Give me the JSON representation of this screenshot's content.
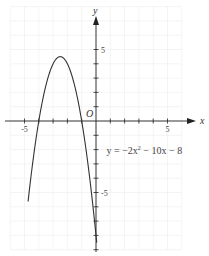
{
  "chart_data": {
    "type": "line",
    "title": "",
    "xlabel": "x",
    "ylabel": "y",
    "origin_label": "O",
    "xlim": [
      -6,
      6
    ],
    "ylim": [
      -9,
      8
    ],
    "grid": true,
    "x_tick_labels": [
      {
        "value": -5,
        "label": "-5"
      },
      {
        "value": 5,
        "label": "5"
      }
    ],
    "y_tick_labels": [
      {
        "value": 5,
        "label": "5"
      },
      {
        "value": -5,
        "label": "-5"
      }
    ],
    "series": [
      {
        "name": "y = -2x² - 10x - 8",
        "function": {
          "a": -2,
          "b": -10,
          "c": -8
        },
        "x_range": [
          -4.75,
          0.05
        ],
        "vertex": [
          -2.5,
          4.5
        ],
        "roots": [
          -4,
          -1
        ]
      }
    ],
    "annotation": {
      "text_parts": [
        "y = −2x",
        "2",
        " − 10x − 8"
      ],
      "at": [
        0.6,
        -2
      ]
    }
  }
}
